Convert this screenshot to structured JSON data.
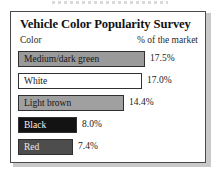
{
  "card": {
    "title": "Vehicle Color Popularity Survey",
    "header_left": "Color",
    "header_right": "% of the market"
  },
  "chart_data": {
    "type": "bar",
    "orientation": "horizontal",
    "title": "Vehicle Color Popularity Survey",
    "xlabel": "% of the market",
    "ylabel": "Color",
    "grid": false,
    "legend": false,
    "xlim": [
      0,
      20
    ],
    "categories": [
      "Medium/dark green",
      "White",
      "Light brown",
      "Black",
      "Red"
    ],
    "values": [
      17.5,
      17.0,
      14.4,
      8.0,
      7.4
    ],
    "value_labels": [
      "17.5%",
      "17.0%",
      "14.4%",
      "8.0%",
      "7.4%"
    ],
    "bars": [
      {
        "label": "Medium/dark green",
        "value": 17.5,
        "value_label": "17.5%",
        "fill": "#9a9a9a",
        "text_color": "#151515",
        "width_px": 127
      },
      {
        "label": "White",
        "value": 17.0,
        "value_label": "17.0%",
        "fill": "#ffffff",
        "text_color": "#151515",
        "width_px": 124
      },
      {
        "label": "Light brown",
        "value": 14.4,
        "value_label": "14.4%",
        "fill": "#a0a0a0",
        "text_color": "#151515",
        "width_px": 106
      },
      {
        "label": "Black",
        "value": 8.0,
        "value_label": "8.0%",
        "fill": "#131313",
        "text_color": "#f2f2f2",
        "width_px": 59
      },
      {
        "label": "Red",
        "value": 7.4,
        "value_label": "7.4%",
        "fill": "#4d4d4d",
        "text_color": "#e8e8e8",
        "width_px": 55
      }
    ]
  }
}
